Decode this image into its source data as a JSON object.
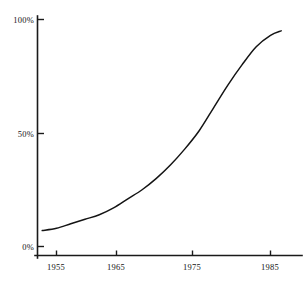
{
  "chart_data": {
    "type": "line",
    "title": "",
    "subtitle": "",
    "xlabel": "",
    "ylabel": "",
    "xlim": [
      1953,
      1986.5
    ],
    "ylim": [
      0,
      100
    ],
    "grid": false,
    "legend": null,
    "x_ticks": [
      1955,
      1965,
      1975,
      1985
    ],
    "x_tick_labels": [
      "1955",
      "1965",
      "1975",
      "1985"
    ],
    "y_ticks": [
      0,
      50,
      100
    ],
    "y_tick_labels": [
      "0%",
      "50%",
      "100%"
    ],
    "series": [
      {
        "name": "adoption",
        "color": "#141414",
        "x": [
          1953,
          1955,
          1957,
          1959,
          1961,
          1963,
          1965,
          1967,
          1969,
          1971,
          1973,
          1975,
          1977,
          1979,
          1981,
          1983,
          1985,
          1986.5
        ],
        "values": [
          7,
          8,
          10,
          12,
          14,
          17,
          21,
          25,
          30,
          36,
          43,
          51,
          61,
          71,
          80,
          88,
          93,
          95
        ]
      }
    ],
    "annotations": []
  },
  "figure": {
    "background_color": "#ffffff",
    "axis_color": "#1a1a1a",
    "title_text": ""
  }
}
